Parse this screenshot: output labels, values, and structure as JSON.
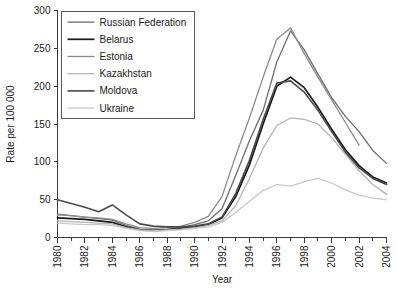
{
  "chart_data": {
    "type": "line",
    "title": "",
    "xlabel": "Year",
    "ylabel": "Rate per 100 000",
    "xlim": [
      1980,
      2004
    ],
    "ylim": [
      0,
      300
    ],
    "yticks": [
      0,
      50,
      100,
      150,
      200,
      250,
      300
    ],
    "xticks": [
      1980,
      1982,
      1984,
      1986,
      1988,
      1990,
      1992,
      1994,
      1996,
      1998,
      2000,
      2002,
      2004
    ],
    "xminor": [
      1981,
      1983,
      1985,
      1987,
      1989,
      1991,
      1993,
      1995,
      1997,
      1999,
      2001,
      2003
    ],
    "grid": false,
    "legend_position": "top-left",
    "x": [
      1980,
      1981,
      1982,
      1983,
      1984,
      1985,
      1986,
      1987,
      1988,
      1989,
      1990,
      1991,
      1992,
      1993,
      1994,
      1995,
      1996,
      1997,
      1998,
      1999,
      2000,
      2001,
      2002,
      2003,
      2004
    ],
    "series": [
      {
        "name": "Russian Federation",
        "color": "#6e6e6e",
        "width": 1.3,
        "values": [
          31,
          29,
          27,
          25,
          23,
          16,
          11,
          10,
          11,
          13,
          17,
          22,
          38,
          82,
          128,
          168,
          232,
          273,
          248,
          216,
          185,
          160,
          140,
          115,
          98
        ]
      },
      {
        "name": "Belarus",
        "color": "#1a1a1a",
        "width": 1.7,
        "values": [
          26,
          25,
          24,
          22,
          20,
          14,
          10,
          9,
          10,
          12,
          14,
          17,
          26,
          54,
          96,
          150,
          200,
          212,
          198,
          172,
          143,
          116,
          95,
          80,
          72
        ]
      },
      {
        "name": "Estonia",
        "color": "#8c8c8c",
        "width": 1.3,
        "values": [
          30,
          29,
          27,
          26,
          24,
          18,
          13,
          12,
          13,
          15,
          20,
          28,
          54,
          108,
          158,
          212,
          262,
          277,
          243,
          212,
          182,
          152,
          122,
          null,
          null
        ]
      },
      {
        "name": "Kazakhstan",
        "color": "#b4b4b4",
        "width": 1.3,
        "values": [
          22,
          21,
          20,
          19,
          18,
          13,
          10,
          9,
          10,
          11,
          13,
          16,
          22,
          42,
          78,
          118,
          148,
          158,
          156,
          150,
          132,
          110,
          88,
          70,
          57
        ]
      },
      {
        "name": "Moldova",
        "color": "#4a4a4a",
        "width": 1.6,
        "values": [
          50,
          45,
          40,
          34,
          43,
          30,
          18,
          15,
          14,
          14,
          15,
          18,
          27,
          58,
          102,
          156,
          204,
          207,
          192,
          168,
          140,
          113,
          92,
          78,
          70
        ]
      },
      {
        "name": "Ukraine",
        "color": "#c8c8c8",
        "width": 1.3,
        "values": [
          19,
          18,
          17,
          17,
          16,
          12,
          9,
          8,
          9,
          10,
          12,
          14,
          20,
          33,
          48,
          62,
          70,
          68,
          74,
          78,
          72,
          63,
          56,
          52,
          50
        ]
      }
    ]
  },
  "legend": {
    "entries": [
      {
        "label": "Russian Federation"
      },
      {
        "label": "Belarus"
      },
      {
        "label": "Estonia"
      },
      {
        "label": "Kazakhstan"
      },
      {
        "label": "Moldova"
      },
      {
        "label": "Ukraine"
      }
    ]
  }
}
